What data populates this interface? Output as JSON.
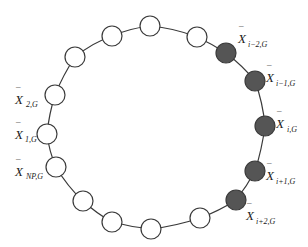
{
  "diagram": {
    "type": "ring-topology",
    "ring_color": "#3a3a3a",
    "empty_fill": "#ffffff",
    "filled_fill": "#555555",
    "node_radius": 10,
    "nodes": [
      {
        "x": 47,
        "y": 134,
        "filled": false
      },
      {
        "x": 55,
        "y": 95,
        "filled": false
      },
      {
        "x": 75,
        "y": 57,
        "filled": false
      },
      {
        "x": 112,
        "y": 36,
        "filled": false
      },
      {
        "x": 150,
        "y": 26,
        "filled": false
      },
      {
        "x": 197,
        "y": 37,
        "filled": false
      },
      {
        "x": 226,
        "y": 53,
        "filled": true
      },
      {
        "x": 255,
        "y": 81,
        "filled": true
      },
      {
        "x": 265,
        "y": 126,
        "filled": true
      },
      {
        "x": 255,
        "y": 171,
        "filled": true
      },
      {
        "x": 236,
        "y": 200,
        "filled": true
      },
      {
        "x": 200,
        "y": 218,
        "filled": false
      },
      {
        "x": 151,
        "y": 229,
        "filled": false
      },
      {
        "x": 112,
        "y": 222,
        "filled": false
      },
      {
        "x": 83,
        "y": 201,
        "filled": false
      },
      {
        "x": 56,
        "y": 167,
        "filled": false
      }
    ],
    "labels": {
      "x2": {
        "main": "X",
        "sub": "2,G"
      },
      "x1": {
        "main": "X",
        "sub": "1,G"
      },
      "xnp": {
        "main": "X",
        "sub": "NP,G"
      },
      "xim2": {
        "main": "X",
        "sub": "i−2,G"
      },
      "xim1": {
        "main": "X",
        "sub": "i−1,G"
      },
      "xi": {
        "main": "X",
        "sub": "i,G"
      },
      "xip1": {
        "main": "X",
        "sub": "i+1,G"
      },
      "xip2": {
        "main": "X",
        "sub": "i+2,G"
      }
    }
  }
}
